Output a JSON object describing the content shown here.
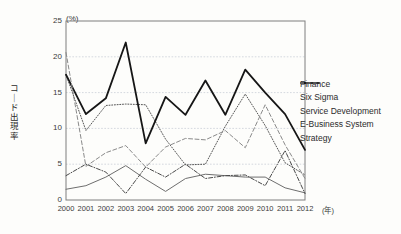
{
  "chart_data": {
    "type": "line",
    "title": "",
    "xlabel": "(年)",
    "ylabel": "コード出現率",
    "yunit": "(%)",
    "ylim": [
      0,
      25
    ],
    "yticks": [
      0,
      5,
      10,
      15,
      20,
      25
    ],
    "grid": true,
    "legend_position": "right",
    "categories": [
      "2000",
      "2001",
      "2002",
      "2003",
      "2004",
      "2005",
      "2006",
      "2007",
      "2008",
      "2009",
      "2010",
      "2011",
      "2012"
    ],
    "series": [
      {
        "name": "Finance",
        "style": "thin-solid-gray",
        "color": "#6e6e6e",
        "values": [
          1.5,
          2.0,
          3.2,
          4.8,
          2.9,
          1.2,
          3.0,
          3.6,
          3.4,
          3.2,
          3.2,
          1.7,
          1.0
        ]
      },
      {
        "name": "Six Sigma",
        "style": "dotted",
        "color": "#555555",
        "values": [
          17.5,
          9.7,
          13.2,
          13.4,
          13.3,
          8.5,
          4.9,
          5.0,
          10.3,
          14.8,
          10.4,
          5.2,
          3.5
        ]
      },
      {
        "name": "Service Development",
        "style": "thick-solid-black",
        "color": "#161616",
        "values": [
          17.5,
          12.0,
          14.2,
          22.0,
          7.9,
          14.4,
          11.9,
          16.7,
          11.9,
          18.2,
          15.0,
          12.0,
          7.0
        ]
      },
      {
        "name": "E-Business System",
        "style": "dash-dot",
        "color": "#4a4a4a",
        "values": [
          3.4,
          5.0,
          3.9,
          0.9,
          4.6,
          3.2,
          5.0,
          3.0,
          3.4,
          3.5,
          2.0,
          6.9,
          0.9
        ]
      },
      {
        "name": "Strategy",
        "style": "dashed",
        "color": "#8a8a8a",
        "values": [
          20.6,
          4.7,
          6.6,
          7.6,
          4.6,
          7.4,
          8.6,
          8.4,
          9.7,
          7.3,
          13.3,
          7.7,
          3.0
        ]
      }
    ]
  },
  "legend": {
    "items": [
      {
        "label": "Finance"
      },
      {
        "label": "Six Sigma"
      },
      {
        "label": "Service Development"
      },
      {
        "label": "E-Business System"
      },
      {
        "label": "Strategy"
      }
    ]
  },
  "axes": {
    "y_unit_label": "(%)",
    "y_axis_title": "コード出現率",
    "x_unit_label": "(年)",
    "y_tick_labels": [
      "25",
      "20",
      "15",
      "10",
      "5",
      "0"
    ],
    "x_tick_labels": [
      "2000",
      "2001",
      "2002",
      "2003",
      "2004",
      "2005",
      "2006",
      "2007",
      "2008",
      "2009",
      "2010",
      "2011",
      "2012"
    ]
  }
}
